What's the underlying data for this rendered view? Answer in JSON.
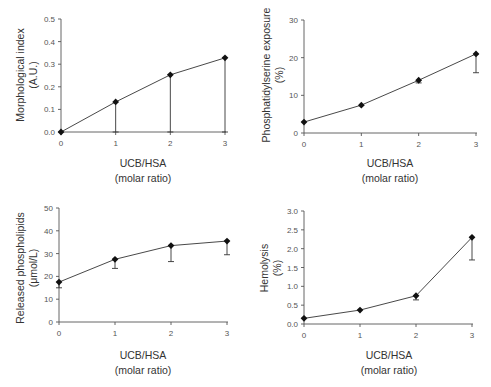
{
  "figure": {
    "panels": [
      {
        "id": "morphological-index",
        "ylabel_line1": "Morphological index",
        "ylabel_line2": "(A.U.)",
        "xlabel_line1": "UCB/HSA",
        "xlabel_line2": "(molar ratio)"
      },
      {
        "id": "phosphatidylserine-exposure",
        "ylabel_line1": "Phosphatidylserine exposure",
        "ylabel_line2": "(%)",
        "xlabel_line1": "UCB/HSA",
        "xlabel_line2": "(molar ratio)"
      },
      {
        "id": "released-phospholipids",
        "ylabel_line1": "Released phospholipids",
        "ylabel_line2": "(μmol/L)",
        "xlabel_line1": "UCB/HSA",
        "xlabel_line2": "(molar ratio)"
      },
      {
        "id": "hemolysis",
        "ylabel_line1": "Hemolysis",
        "ylabel_line2": "(%)",
        "xlabel_line1": "UCB/HSA",
        "xlabel_line2": "(molar ratio)"
      }
    ]
  },
  "chart_data": [
    {
      "type": "line",
      "title": "",
      "xlabel": "UCB/HSA (molar ratio)",
      "ylabel": "Morphological index (A.U.)",
      "x": [
        0,
        1,
        2,
        3
      ],
      "series": [
        {
          "name": "Morphological index",
          "values": [
            0.0,
            0.133,
            0.253,
            0.328
          ],
          "error_low": [
            0.0,
            0.0,
            0.0,
            0.0
          ]
        }
      ],
      "xticks": [
        "0",
        "1",
        "2",
        "3"
      ],
      "yticks": [
        "0.0",
        "0.1",
        "0.2",
        "0.3",
        "0.4",
        "0.5"
      ],
      "xlim": [
        0,
        3
      ],
      "ylim": [
        0,
        0.5
      ],
      "grid": false,
      "legend": "none",
      "layout": {
        "x0": 61,
        "x3": 225,
        "y0": 132,
        "ytop": 19
      }
    },
    {
      "type": "line",
      "title": "",
      "xlabel": "UCB/HSA (molar ratio)",
      "ylabel": "Phosphatidylserine exposure (%)",
      "x": [
        0,
        1,
        2,
        3
      ],
      "series": [
        {
          "name": "Phosphatidylserine exposure",
          "values": [
            2.9,
            7.4,
            14.0,
            21.0
          ],
          "error_low": [
            2.9,
            7.4,
            13.3,
            16.0
          ]
        }
      ],
      "xticks": [
        "0",
        "1",
        "2",
        "3"
      ],
      "yticks": [
        "0",
        "10",
        "20",
        "30"
      ],
      "xlim": [
        0,
        3
      ],
      "ylim": [
        0,
        30
      ],
      "grid": false,
      "legend": "none",
      "layout": {
        "x0": 304,
        "x3": 476,
        "y0": 133,
        "ytop": 20
      }
    },
    {
      "type": "line",
      "title": "",
      "xlabel": "UCB/HSA (molar ratio)",
      "ylabel": "Released phospholipids (μmol/L)",
      "x": [
        0,
        1,
        2,
        3
      ],
      "series": [
        {
          "name": "Released phospholipids",
          "values": [
            17.5,
            27.5,
            33.5,
            35.5
          ],
          "error_low": [
            15.0,
            23.5,
            26.5,
            29.5
          ]
        }
      ],
      "xticks": [
        "0",
        "1",
        "2",
        "3"
      ],
      "yticks": [
        "0",
        "10",
        "20",
        "30",
        "40",
        "50"
      ],
      "xlim": [
        0,
        3
      ],
      "ylim": [
        0,
        50
      ],
      "grid": false,
      "legend": "none",
      "layout": {
        "x0": 59,
        "x3": 227,
        "y0": 322,
        "ytop": 208
      }
    },
    {
      "type": "line",
      "title": "",
      "xlabel": "UCB/HSA (molar ratio)",
      "ylabel": "Hemolysis (%)",
      "x": [
        0,
        1,
        2,
        3
      ],
      "series": [
        {
          "name": "Hemolysis",
          "values": [
            0.15,
            0.37,
            0.75,
            2.3
          ],
          "error_low": [
            0.15,
            0.37,
            0.64,
            1.7
          ]
        }
      ],
      "xticks": [
        "0",
        "1",
        "2",
        "3"
      ],
      "yticks": [
        "0.0",
        "0.5",
        "1.0",
        "1.5",
        "2.0",
        "2.5",
        "3.0"
      ],
      "xlim": [
        0,
        3
      ],
      "ylim": [
        0,
        3
      ],
      "grid": false,
      "legend": "none",
      "layout": {
        "x0": 304,
        "x3": 472,
        "y0": 324,
        "ytop": 211
      }
    }
  ]
}
